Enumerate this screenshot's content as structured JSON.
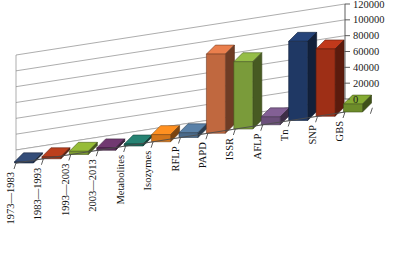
{
  "chart_data": {
    "type": "bar",
    "title": "",
    "subtitle": "",
    "xlabel": "",
    "ylabel": "",
    "three_d": true,
    "grid": true,
    "legend": "none",
    "ylim": [
      0,
      120000
    ],
    "ytick_step": 20000,
    "ytick_labels": [
      "0",
      "20000",
      "40000",
      "60000",
      "80000",
      "100000",
      "120000"
    ],
    "ytick_values": [
      0,
      20000,
      40000,
      60000,
      80000,
      100000,
      120000
    ],
    "categories": [
      "1973—1983",
      "1983—1993",
      "1993—2003",
      "2003—2013",
      "Metabolites",
      "Isozymes",
      "RFLP",
      "PAPD",
      "ISSR",
      "AFLP",
      "Tn",
      "SNP",
      "GBS"
    ],
    "values": [
      1500,
      2500,
      4000,
      6000,
      5000,
      4500,
      5500,
      4000,
      3500,
      12000,
      100000,
      85000,
      10000
    ],
    "bar_colors": [
      "#1f3864",
      "#9e2f16",
      "#6d8c2a",
      "#5b2d5b",
      "#1f6b5e",
      "#d4761a",
      "#4a6a8a",
      "#c0683f",
      "#7a9b3a",
      "#6b4f7a"
    ],
    "series_bars": [
      {
        "category": "1973—1983",
        "value": 1500,
        "color": "#2b3f63"
      },
      {
        "category": "1983—1993",
        "value": 2500,
        "color": "#9a3418"
      },
      {
        "category": "1993—2003",
        "value": 4000,
        "color": "#7b9a2e"
      },
      {
        "category": "2003—2013",
        "value": 3000,
        "color": "#5d2f5d"
      },
      {
        "category": "Metabolites",
        "value": 2500,
        "color": "#1f6b5e"
      },
      {
        "category": "Isozymes",
        "value": 9000,
        "color": "#d4761a"
      },
      {
        "category": "RFLP",
        "value": 6000,
        "color": "#4a6a8a"
      },
      {
        "category": "PAPD",
        "value": 100000,
        "color": "#c0683f"
      },
      {
        "category": "ISSR",
        "value": 85000,
        "color": "#7a9b3a"
      },
      {
        "category": "AFLP",
        "value": 10000,
        "color": "#6b4f7a"
      }
    ]
  },
  "axis": {
    "y_axis_name": "value-axis",
    "x_axis_name": "category-axis"
  }
}
